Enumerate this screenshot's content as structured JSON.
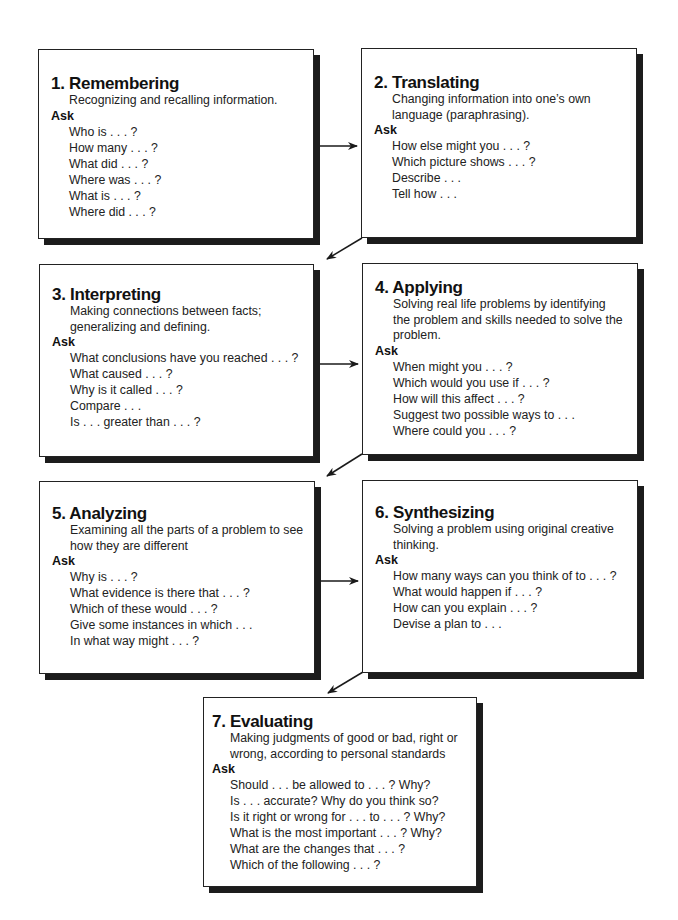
{
  "diagram": {
    "ask_label": "Ask",
    "boxes": [
      {
        "title": "1. Remembering",
        "description": [
          "Recognizing and recalling information."
        ],
        "questions": [
          "Who is . . . ?",
          "How many . . . ?",
          "What did . . . ?",
          "Where was . . . ?",
          "What is . . . ?",
          "Where did . . . ?"
        ]
      },
      {
        "title": "2. Translating",
        "description": [
          "Changing information into one’s own",
          "language (paraphrasing)."
        ],
        "questions": [
          "How else might you . . . ?",
          "Which picture shows . . . ?",
          "Describe . . .",
          "Tell how . . ."
        ]
      },
      {
        "title": "3. Interpreting",
        "description": [
          "Making connections between facts;",
          "generalizing and defining."
        ],
        "questions": [
          "What conclusions have you reached . . . ?",
          "What caused . . . ?",
          "Why is it called . . . ?",
          "Compare . . .",
          "Is . . . greater than . . . ?"
        ]
      },
      {
        "title": "4. Applying",
        "description": [
          "Solving real life problems by identifying",
          "the problem and skills needed to solve the",
          "problem."
        ],
        "questions": [
          "When might you . . . ?",
          "Which would you use if . . . ?",
          "How will this affect . . . ?",
          "Suggest two possible ways to  . . .",
          "Where could you . . . ?"
        ]
      },
      {
        "title": "5. Analyzing",
        "description": [
          "Examining all the parts of a problem to see",
          "how they are different"
        ],
        "questions": [
          "Why is . . . ?",
          "What evidence is there that . . . ?",
          "Which of these would . . . ?",
          "Give some instances in which . . .",
          "In what way might . . . ?"
        ]
      },
      {
        "title": "6. Synthesizing",
        "description": [
          "Solving a problem using original creative",
          "thinking."
        ],
        "questions": [
          "How many ways can you think of to . . . ?",
          "What would happen if . . . ?",
          "How can you explain . . . ?",
          "Devise a plan to . . ."
        ]
      },
      {
        "title": "7. Evaluating",
        "description": [
          "Making judgments of good or bad, right or",
          "wrong, according to personal standards"
        ],
        "questions": [
          "Should . . . be allowed to . . . ? Why?",
          "Is . . . accurate? Why do you think so?",
          "Is it right or wrong for . . . to . . . ? Why?",
          "What is the most important . . . ? Why?",
          "What are the changes that . . . ?",
          "Which of the following . . . ?"
        ]
      }
    ],
    "colors": {
      "border": "#222222",
      "shadow": "#1c1c1c",
      "text": "#1a1a1a",
      "background": "#ffffff"
    }
  }
}
